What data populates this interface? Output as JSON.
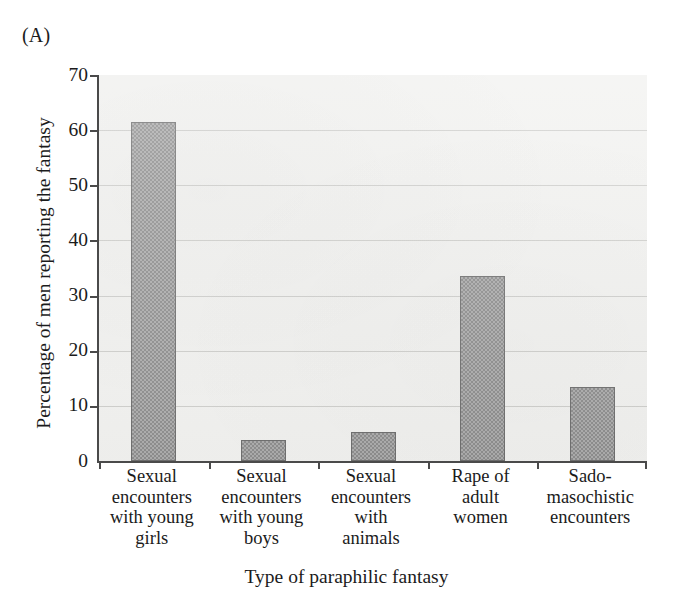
{
  "panel": {
    "letter": "(A)"
  },
  "chart_data": {
    "type": "bar",
    "title": "",
    "panel_label": "(A)",
    "xlabel": "Type of paraphilic fantasy",
    "ylabel": "Percentage of men reporting the fantasy",
    "ylim": [
      0,
      70
    ],
    "ytick_step": 10,
    "yticks": [
      0,
      10,
      20,
      30,
      40,
      50,
      60,
      70
    ],
    "ytick_labels": [
      "0",
      "10",
      "20",
      "30",
      "40",
      "50",
      "60",
      "70"
    ],
    "grid": "horizontal",
    "legend": "none",
    "bar_color": "#9d9d9d",
    "bar_edge_color": "#6f6f6f",
    "plot_background": "#f2f2f0",
    "categories": [
      "Sexual encounters with young girls",
      "Sexual encounters with young boys",
      "Sexual encounters with animals",
      "Rape of adult women",
      "Sado-masochistic encounters"
    ],
    "category_lines": [
      [
        "Sexual",
        "encounters",
        "with young",
        "girls"
      ],
      [
        "Sexual",
        "encounters",
        "with young",
        "boys"
      ],
      [
        "Sexual",
        "encounters",
        "with",
        "animals"
      ],
      [
        "Rape of",
        "adult",
        "women"
      ],
      [
        "Sado-",
        "masochistic",
        "encounters"
      ]
    ],
    "values": [
      61.4,
      3.8,
      5.3,
      33.5,
      13.4
    ]
  },
  "axis": {
    "y": {
      "t0": "0",
      "t1": "10",
      "t2": "20",
      "t3": "30",
      "t4": "40",
      "t5": "50",
      "t6": "60",
      "t7": "70"
    },
    "x_title": "Type of paraphilic fantasy",
    "y_title": "Percentage of men reporting the fantasy"
  },
  "xcats": [
    {
      "l0": "Sexual",
      "l1": "encounters",
      "l2": "with young",
      "l3": "girls"
    },
    {
      "l0": "Sexual",
      "l1": "encounters",
      "l2": "with young",
      "l3": "boys"
    },
    {
      "l0": "Sexual",
      "l1": "encounters",
      "l2": "with",
      "l3": "animals"
    },
    {
      "l0": "Rape of",
      "l1": "adult",
      "l2": "women",
      "l3": ""
    },
    {
      "l0": "Sado-",
      "l1": "masochistic",
      "l2": "encounters",
      "l3": ""
    }
  ]
}
